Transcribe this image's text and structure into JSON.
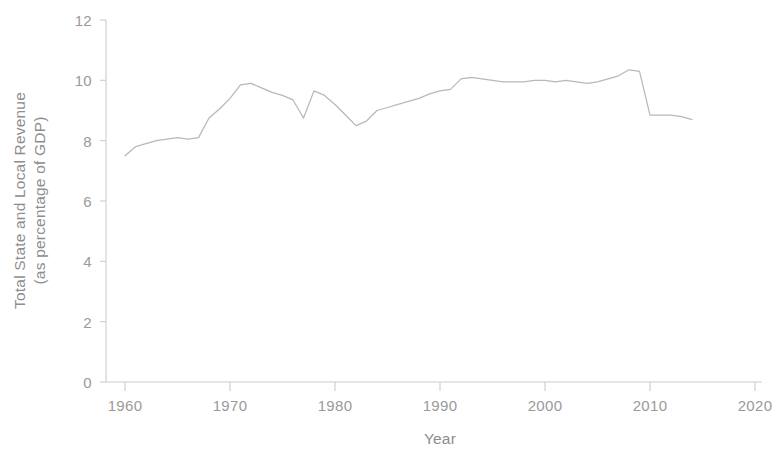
{
  "chart_data": {
    "type": "line",
    "title": "",
    "xlabel": "Year",
    "ylabel": "Total State and Local Revenue (as percentage of GDP)",
    "ylabel_line1": "Total State and Local Revenue",
    "ylabel_line2": "(as percentage of GDP)",
    "xlim": [
      1960,
      2020
    ],
    "ylim": [
      0,
      12
    ],
    "xticks": [
      1960,
      1970,
      1980,
      1990,
      2000,
      2010,
      2020
    ],
    "xtick_labels": [
      "1960",
      "1970",
      "1980",
      "1990",
      "2000",
      "2010",
      "2020"
    ],
    "yticks": [
      0,
      2,
      4,
      6,
      8,
      10,
      12
    ],
    "ytick_labels": [
      "0",
      "2",
      "4",
      "6",
      "8",
      "10",
      "12"
    ],
    "grid": false,
    "legend": false,
    "line_color": "#b8b8b8",
    "axis_color": "#c9c9c9",
    "text_color": "#919191",
    "series": [
      {
        "name": "Total State and Local Revenue",
        "x": [
          1960,
          1961,
          1962,
          1963,
          1964,
          1965,
          1966,
          1967,
          1968,
          1969,
          1970,
          1971,
          1972,
          1973,
          1974,
          1975,
          1976,
          1977,
          1978,
          1979,
          1980,
          1981,
          1982,
          1983,
          1984,
          1985,
          1986,
          1987,
          1988,
          1989,
          1990,
          1991,
          1992,
          1993,
          1994,
          1995,
          1996,
          1997,
          1998,
          1999,
          2000,
          2001,
          2002,
          2003,
          2004,
          2005,
          2006,
          2007,
          2008,
          2009,
          2010,
          2011,
          2012,
          2013,
          2014
        ],
        "values": [
          7.5,
          7.8,
          7.9,
          8.0,
          8.05,
          8.1,
          8.05,
          8.1,
          8.75,
          9.05,
          9.4,
          9.85,
          9.9,
          9.75,
          9.6,
          9.5,
          9.35,
          8.75,
          9.65,
          9.5,
          9.2,
          8.85,
          8.5,
          8.65,
          9.0,
          9.1,
          9.2,
          9.3,
          9.4,
          9.55,
          9.65,
          9.7,
          10.05,
          10.1,
          10.05,
          10.0,
          9.95,
          9.95,
          9.95,
          10.0,
          10.0,
          9.95,
          10.0,
          9.95,
          9.9,
          9.95,
          10.05,
          10.15,
          10.35,
          10.3,
          8.85,
          8.85,
          8.85,
          8.8,
          8.7
        ]
      }
    ]
  },
  "axis": {
    "y_tick_0": "0",
    "y_tick_1": "2",
    "y_tick_2": "4",
    "y_tick_3": "6",
    "y_tick_4": "8",
    "y_tick_5": "10",
    "y_tick_6": "12",
    "x_tick_0": "1960",
    "x_tick_1": "1970",
    "x_tick_2": "1980",
    "x_tick_3": "1990",
    "x_tick_4": "2000",
    "x_tick_5": "2010",
    "x_tick_6": "2020"
  }
}
